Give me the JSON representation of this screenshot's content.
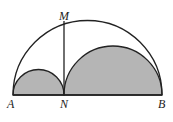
{
  "figure": {
    "labels": {
      "A": "A",
      "N": "N",
      "B": "B",
      "M": "M"
    },
    "fill_color": "#b5b5b5",
    "stroke_color": "#222222"
  }
}
